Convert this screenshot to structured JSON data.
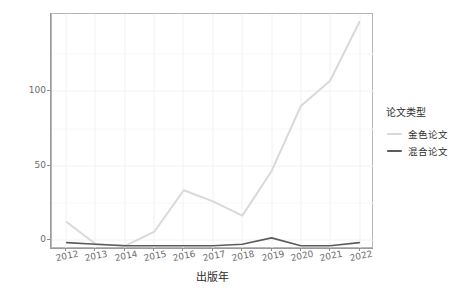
{
  "chart_data": {
    "type": "line",
    "title": "",
    "xlabel": "出版年",
    "ylabel": "APC费用（万元）",
    "x": [
      2012,
      2013,
      2014,
      2015,
      2016,
      2017,
      2018,
      2019,
      2020,
      2021,
      2022
    ],
    "xtick_labels": [
      "2012",
      "2013",
      "2014",
      "2015",
      "2016",
      "2017",
      "2018",
      "2019",
      "2020",
      "2021",
      "2022"
    ],
    "ytick_labels": [
      "0",
      "50",
      "100"
    ],
    "ytick_values": [
      0,
      50,
      100
    ],
    "xlim": [
      2011.5,
      2022.5
    ],
    "ylim": [
      0,
      148
    ],
    "grid": true,
    "legend_position": "right",
    "legend_title": "论文类型",
    "series": [
      {
        "name": "金色论文",
        "color": "#d9d9d9",
        "values": [
          17,
          3,
          2,
          11,
          37,
          30,
          21,
          49,
          90,
          106,
          143
        ]
      },
      {
        "name": "混合论文",
        "color": "#5c5c5c",
        "values": [
          4,
          3,
          2,
          2,
          2,
          2,
          3,
          7,
          2,
          2,
          4
        ]
      }
    ]
  },
  "legend": {
    "title": "论文类型",
    "items": [
      {
        "label": "金色论文",
        "color": "#d9d9d9"
      },
      {
        "label": "混合论文",
        "color": "#5c5c5c"
      }
    ]
  },
  "axes": {
    "x_title": "出版年",
    "y_title": "APC费用（万元）"
  },
  "colors": {
    "panel_background": "#ffffff",
    "grid": "#f2f2f2",
    "axis": "#9a9a9a",
    "text": "#4d4d4d",
    "gold_series": "#d9d9d9",
    "hybrid_series": "#5c5c5c"
  }
}
